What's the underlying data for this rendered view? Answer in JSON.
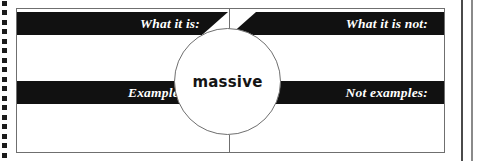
{
  "organizer": {
    "concept_term": "massive",
    "quadrants": [
      {
        "id": "what-it-is",
        "label": "What it is:",
        "content": ""
      },
      {
        "id": "what-it-is-not",
        "label": "What it is not:",
        "content": ""
      },
      {
        "id": "examples",
        "label": "Examples:",
        "content": ""
      },
      {
        "id": "not-examples",
        "label": "Not examples:",
        "content": ""
      }
    ]
  },
  "colors": {
    "bar_fill": "#111111",
    "bar_text": "#ffffff",
    "rule": "#6f6f6f",
    "page_background": "#ffffff",
    "binding_dot": "#1b1b1b"
  },
  "page_furniture": {
    "binding_dot_count": 17,
    "right_edge_rule_count": 2
  }
}
